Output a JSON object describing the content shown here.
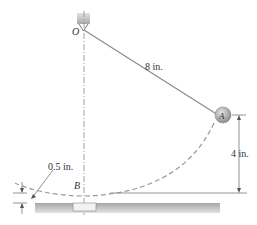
{
  "diagram": {
    "pivot_label": "O",
    "bob_label": "A",
    "bottom_label": "B",
    "length_label": "8 in.",
    "height_label": "4 in.",
    "clearance_label": "0.5 in.",
    "colors": {
      "line": "#7a7a7a",
      "dashed": "#9a9a9a",
      "ground": "#c8c8c8",
      "bob": "#a9a9a9",
      "text": "#333333"
    }
  }
}
